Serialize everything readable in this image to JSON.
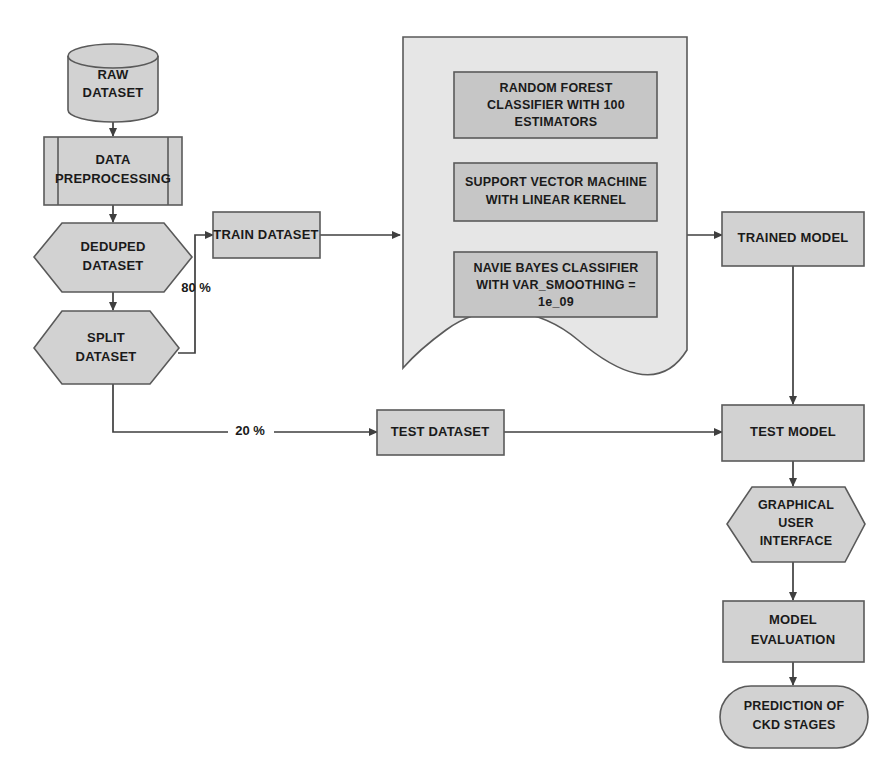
{
  "diagram": {
    "colors": {
      "shape_fill": "#d2d2d2",
      "container_fill": "#e6e6e6",
      "inner_box_fill": "#c6c6c6",
      "stroke": "#5a5a5a",
      "edge_stroke": "#3f3f3f",
      "text": "#1a1a1a",
      "background": "#ffffff"
    },
    "nodes": [
      {
        "id": "raw-dataset",
        "label": "RAW\nDATASET",
        "shape": "cylinder"
      },
      {
        "id": "data-preprocessing",
        "label": "DATA\nPREPROCESSING",
        "shape": "predefined-process"
      },
      {
        "id": "deduped-dataset",
        "label": "DEDUPED\nDATASET",
        "shape": "hexagon"
      },
      {
        "id": "split-dataset",
        "label": "SPLIT\nDATASET",
        "shape": "hexagon"
      },
      {
        "id": "train-dataset",
        "label": "TRAIN DATASET",
        "shape": "rectangle"
      },
      {
        "id": "test-dataset",
        "label": "TEST DATASET",
        "shape": "rectangle"
      },
      {
        "id": "model-container",
        "label": "",
        "shape": "document"
      },
      {
        "id": "random-forest",
        "label": "RANDOM FOREST\nCLASSIFIER WITH 100\nESTIMATORS",
        "shape": "rectangle"
      },
      {
        "id": "svm",
        "label": "SUPPORT VECTOR MACHINE\nWITH LINEAR KERNEL",
        "shape": "rectangle"
      },
      {
        "id": "naive-bayes",
        "label": "NAVIE BAYES CLASSIFIER\nWITH VAR_SMOOTHING =\n1e_09",
        "shape": "rectangle"
      },
      {
        "id": "trained-model",
        "label": "TRAINED MODEL",
        "shape": "rectangle"
      },
      {
        "id": "test-model",
        "label": "TEST MODEL",
        "shape": "rectangle"
      },
      {
        "id": "gui",
        "label": "GRAPHICAL\nUSER\nINTERFACE",
        "shape": "hexagon-preparation"
      },
      {
        "id": "model-evaluation",
        "label": "MODEL\nEVALUATION",
        "shape": "rectangle"
      },
      {
        "id": "prediction",
        "label": "PREDICTION OF\nCKD STAGES",
        "shape": "rounded-terminator"
      }
    ],
    "labels": {
      "raw_dataset_line1": "RAW",
      "raw_dataset_line2": "DATASET",
      "data_preprocessing_line1": "DATA",
      "data_preprocessing_line2": "PREPROCESSING",
      "deduped_line1": "DEDUPED",
      "deduped_line2": "DATASET",
      "split_line1": "SPLIT",
      "split_line2": "DATASET",
      "train_dataset": "TRAIN DATASET",
      "test_dataset": "TEST DATASET",
      "random_forest_line1": "RANDOM FOREST",
      "random_forest_line2": "CLASSIFIER WITH 100",
      "random_forest_line3": "ESTIMATORS",
      "svm_line1": "SUPPORT VECTOR MACHINE",
      "svm_line2": "WITH LINEAR KERNEL",
      "naive_bayes_line1": "NAVIE BAYES CLASSIFIER",
      "naive_bayes_line2": "WITH VAR_SMOOTHING =",
      "naive_bayes_line3": "1e_09",
      "trained_model": "TRAINED MODEL",
      "test_model": "TEST MODEL",
      "gui_line1": "GRAPHICAL",
      "gui_line2": "USER",
      "gui_line3": "INTERFACE",
      "model_evaluation_line1": "MODEL",
      "model_evaluation_line2": "EVALUATION",
      "prediction_line1": "PREDICTION OF",
      "prediction_line2": "CKD STAGES",
      "split_train_pct": "80 %",
      "split_test_pct": "20 %"
    },
    "edges": [
      {
        "id": "raw-to-preprocessing",
        "from": "raw-dataset",
        "to": "data-preprocessing",
        "label": ""
      },
      {
        "id": "preprocessing-to-deduped",
        "from": "data-preprocessing",
        "to": "deduped-dataset",
        "label": ""
      },
      {
        "id": "deduped-to-split",
        "from": "deduped-dataset",
        "to": "split-dataset",
        "label": ""
      },
      {
        "id": "split-to-train",
        "from": "split-dataset",
        "to": "train-dataset",
        "label": "80 %"
      },
      {
        "id": "split-to-test",
        "from": "split-dataset",
        "to": "test-dataset",
        "label": "20 %"
      },
      {
        "id": "train-to-models",
        "from": "train-dataset",
        "to": "model-container",
        "label": ""
      },
      {
        "id": "models-to-trained",
        "from": "model-container",
        "to": "trained-model",
        "label": ""
      },
      {
        "id": "trained-to-testmodel",
        "from": "trained-model",
        "to": "test-model",
        "label": ""
      },
      {
        "id": "testdata-to-testmodel",
        "from": "test-dataset",
        "to": "test-model",
        "label": ""
      },
      {
        "id": "testmodel-to-gui",
        "from": "test-model",
        "to": "gui",
        "label": ""
      },
      {
        "id": "gui-to-evaluation",
        "from": "gui",
        "to": "model-evaluation",
        "label": ""
      },
      {
        "id": "evaluation-to-prediction",
        "from": "model-evaluation",
        "to": "prediction",
        "label": ""
      }
    ]
  }
}
